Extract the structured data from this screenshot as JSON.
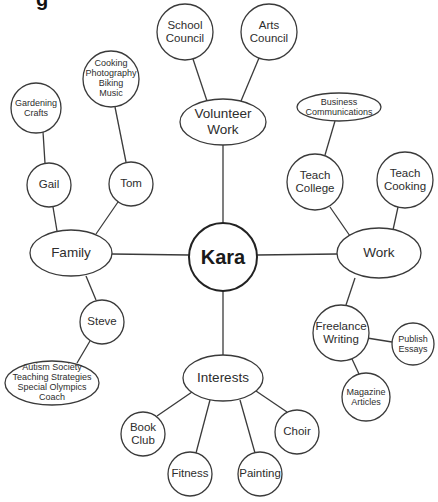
{
  "diagram": {
    "type": "mind-map",
    "title_fragment": "g",
    "colors": {
      "stroke": "#3a3a3a",
      "fill": "#ffffff",
      "text": "#2d2d2d"
    },
    "center": {
      "id": "kara",
      "label": "Kara"
    },
    "nodes": [
      {
        "id": "volunteer-work",
        "lines": [
          "Volunteer",
          "Work"
        ],
        "parent": "kara"
      },
      {
        "id": "school-council",
        "lines": [
          "School",
          "Council"
        ],
        "parent": "volunteer-work"
      },
      {
        "id": "arts-council",
        "lines": [
          "Arts",
          "Council"
        ],
        "parent": "volunteer-work"
      },
      {
        "id": "family",
        "lines": [
          "Family"
        ],
        "parent": "kara"
      },
      {
        "id": "gail",
        "lines": [
          "Gail"
        ],
        "parent": "family"
      },
      {
        "id": "gardening-crafts",
        "lines": [
          "Gardening",
          "Crafts"
        ],
        "parent": "gail"
      },
      {
        "id": "tom",
        "lines": [
          "Tom"
        ],
        "parent": "family"
      },
      {
        "id": "tom-hobbies",
        "lines": [
          "Cooking",
          "Photography",
          "Biking",
          "Music"
        ],
        "parent": "tom"
      },
      {
        "id": "steve",
        "lines": [
          "Steve"
        ],
        "parent": "family"
      },
      {
        "id": "steve-activities",
        "lines": [
          "Autism Society",
          "Teaching Strategies",
          "Special Olympics",
          "Coach"
        ],
        "parent": "steve"
      },
      {
        "id": "work",
        "lines": [
          "Work"
        ],
        "parent": "kara"
      },
      {
        "id": "teach-college",
        "lines": [
          "Teach",
          "College"
        ],
        "parent": "work"
      },
      {
        "id": "business-communications",
        "lines": [
          "Business",
          "Communications"
        ],
        "parent": "teach-college"
      },
      {
        "id": "teach-cooking",
        "lines": [
          "Teach",
          "Cooking"
        ],
        "parent": "work"
      },
      {
        "id": "freelance-writing",
        "lines": [
          "Freelance",
          "Writing"
        ],
        "parent": "work"
      },
      {
        "id": "publish-essays",
        "lines": [
          "Publish",
          "Essays"
        ],
        "parent": "freelance-writing"
      },
      {
        "id": "magazine-articles",
        "lines": [
          "Magazine",
          "Articles"
        ],
        "parent": "freelance-writing"
      },
      {
        "id": "interests",
        "lines": [
          "Interests"
        ],
        "parent": "kara"
      },
      {
        "id": "book-club",
        "lines": [
          "Book",
          "Club"
        ],
        "parent": "interests"
      },
      {
        "id": "fitness",
        "lines": [
          "Fitness"
        ],
        "parent": "interests"
      },
      {
        "id": "painting",
        "lines": [
          "Painting"
        ],
        "parent": "interests"
      },
      {
        "id": "choir",
        "lines": [
          "Choir"
        ],
        "parent": "interests"
      }
    ]
  }
}
